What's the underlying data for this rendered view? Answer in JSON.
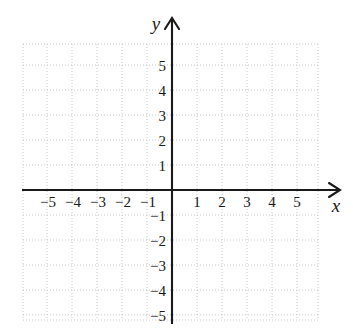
{
  "figure": {
    "kind": "cartesian-coordinate-plane",
    "background_color": "#ffffff",
    "axis_color": "#1a1a1a",
    "grid_color": "#c8c8c8",
    "label_color": "#1a1a1a"
  },
  "axes": {
    "x_axis": {
      "name": "x",
      "label": "x",
      "label_style": "italic-serif",
      "arrow": "right"
    },
    "y_axis": {
      "name": "y",
      "label": "y",
      "label_style": "italic-serif",
      "arrow": "up"
    }
  },
  "chart_data": {
    "type": "scatter",
    "title": "",
    "xlabel": "x",
    "ylabel": "y",
    "grid": true,
    "grid_step": 1,
    "legend": "none",
    "xlim": [
      -6,
      6
    ],
    "ylim": [
      -6,
      6
    ],
    "x_tick_labels": [
      "−5",
      "−4",
      "−3",
      "−2",
      "−1",
      "1",
      "2",
      "3",
      "4",
      "5"
    ],
    "x_tick_values": [
      -5,
      -4,
      -3,
      -2,
      -1,
      1,
      2,
      3,
      4,
      5
    ],
    "y_tick_labels": [
      "5",
      "4",
      "3",
      "2",
      "1",
      "−1",
      "−2",
      "−3",
      "−4",
      "−5"
    ],
    "y_tick_values": [
      5,
      4,
      3,
      2,
      1,
      -1,
      -2,
      -3,
      -4,
      -5
    ],
    "series": [],
    "points": [],
    "annotations": []
  },
  "geometry": {
    "origin_x": 172,
    "origin_y": 190,
    "unit_px": 25,
    "grid_left": 23,
    "grid_right": 318,
    "grid_top": 44,
    "grid_bottom": 320,
    "x_arrow_tip": 340,
    "y_arrow_tip": 18
  }
}
